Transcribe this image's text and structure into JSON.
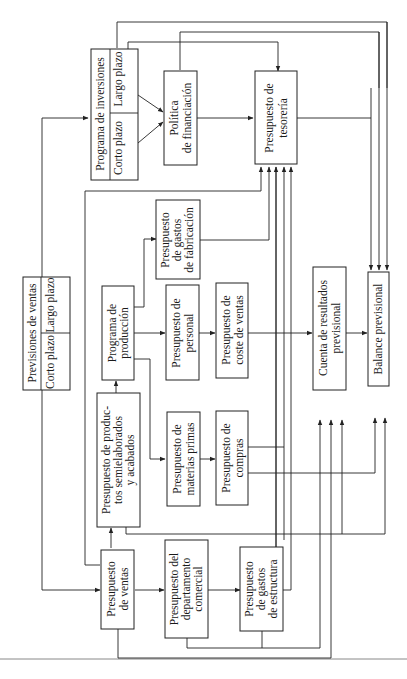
{
  "diagram": {
    "orientation": "rotated-90-ccw",
    "nodes": {
      "previsiones_ventas": {
        "title": "Previsiones de ventas",
        "left": "Corto plazo",
        "right": "Largo plazo"
      },
      "programa_inversiones": {
        "title": "Programa de inversiones",
        "left": "Corto plazo",
        "right": "Largo plazo"
      },
      "politica_financiacion": {
        "line1": "Política",
        "line2": "de financiación"
      },
      "presupuesto_tesoreria": {
        "line1": "Presupuesto de",
        "line2": "tesorería"
      },
      "presupuesto_gastos_fabricacion": {
        "line1": "Presupuesto",
        "line2": "de gastos",
        "line3": "de fabricación"
      },
      "programa_produccion": {
        "line1": "Programa de",
        "line2": "producción"
      },
      "presupuesto_personal": {
        "line1": "Presupuesto de",
        "line2": "personal"
      },
      "presupuesto_coste_ventas": {
        "line1": "Presupuesto de",
        "line2": "coste de ventas"
      },
      "cuenta_resultados": {
        "line1": "Cuenta de resultados",
        "line2": "previsional"
      },
      "balance_previsional": {
        "line1": "Balance previsional"
      },
      "presupuesto_productos": {
        "line1": "Presupuesto de produc-",
        "line2": "tos semielaborados",
        "line3": "y acabados"
      },
      "presupuesto_materias_primas": {
        "line1": "Presupuesto de",
        "line2": "materias primas"
      },
      "presupuesto_compras": {
        "line1": "Presupuesto de",
        "line2": "compras"
      },
      "presupuesto_ventas": {
        "line1": "Presupuesto",
        "line2": "de ventas"
      },
      "presupuesto_departamento_comercial": {
        "line1": "Presupuesto del",
        "line2": "departamento",
        "line3": "comercial"
      },
      "presupuesto_gastos_estructura": {
        "line1": "Presupuesto",
        "line2": "de gastos",
        "line3": "de estructura"
      }
    }
  }
}
